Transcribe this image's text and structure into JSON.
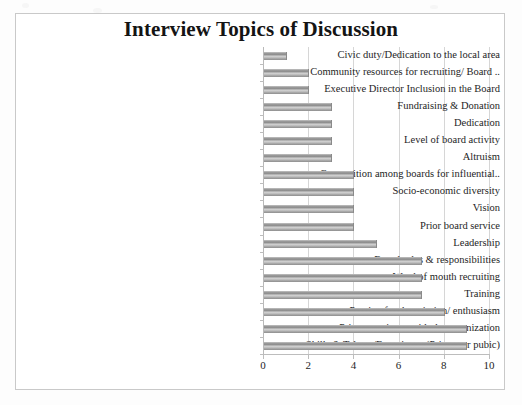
{
  "chart_data": {
    "type": "bar",
    "orientation": "horizontal",
    "title": "Interview Topics of Discussion",
    "xlabel": "",
    "ylabel": "",
    "xlim": [
      0,
      10
    ],
    "xticks": [
      "0",
      "2",
      "4",
      "6",
      "8",
      "10"
    ],
    "grid": true,
    "legend": false,
    "categories": [
      "Civic duty/Dedication to the local area",
      "Community resources for recruiting/ Board ..",
      "Executive Director Inclusion in the Board",
      "Fundraising & Donation",
      "Dedication",
      "Level of board activity",
      "Altruism",
      "Competition among boards for influential..",
      "Socio-economic diversity",
      "Vision",
      "Prior board service",
      "Leadership",
      "Board roles & responsibilities",
      "Word of mouth recruiting",
      "Training",
      "Passion for the mission/ enthusiasm",
      "Prior experience with the organization",
      "Skills & Talents/Experience (Private or pubic)"
    ],
    "values": [
      1,
      2,
      2,
      3,
      3,
      3,
      3,
      4,
      4,
      4,
      4,
      5,
      7,
      7,
      7,
      8,
      9,
      9
    ],
    "bar_color": "#a0a0a0",
    "gridline_color": "#d6d6d6",
    "axis_color": "#bdbdbd",
    "text_color": "#1e1e1e"
  }
}
